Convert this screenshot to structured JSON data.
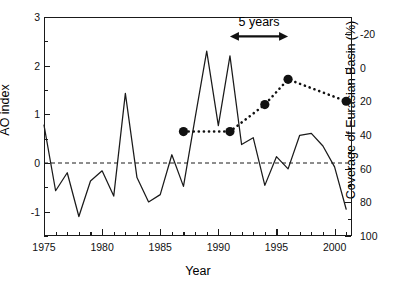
{
  "chart_data": {
    "type": "line",
    "title": "",
    "xlabel": "Year",
    "ylabel": "AO index",
    "ylabel_right": "Coverage of Eurasian Basin (%)",
    "xlim": [
      1975,
      2001.5
    ],
    "ylim": [
      -1.5,
      3
    ],
    "ylim_right": [
      100,
      -30
    ],
    "right_axis_inverted": true,
    "grid": false,
    "legend": "none",
    "x_ticks_major": [
      1975,
      1980,
      1985,
      1990,
      1995,
      2000
    ],
    "x_tick_labels": [
      "1975",
      "1980",
      "1985",
      "1990",
      "1995",
      "2000"
    ],
    "x_minor_tick_step": 1,
    "y_ticks_major_left": [
      -1,
      0,
      1,
      2,
      3
    ],
    "y_tick_labels_left": [
      "-1",
      "0",
      "1",
      "2",
      "3"
    ],
    "y_minor_ticks_left": [
      -1.5,
      -0.5,
      0.5,
      1.5,
      2.5
    ],
    "y_ticks_major_right": [
      -20,
      0,
      20,
      40,
      60,
      80,
      100
    ],
    "y_tick_labels_right": [
      "-20",
      "0",
      "20",
      "40",
      "60",
      "80",
      "100"
    ],
    "y_minor_ticks_right": [
      -30,
      -10,
      10,
      30,
      50,
      70,
      90
    ],
    "reference_line": {
      "axis": "left",
      "value": 0,
      "style": "dashed",
      "label": ""
    },
    "series": [
      {
        "name": "AO index",
        "axis": "left",
        "style": "solid-line",
        "marker": "none",
        "color": "#1a1a1a",
        "x": [
          1975,
          1976,
          1977,
          1978,
          1979,
          1980,
          1981,
          1982,
          1983,
          1984,
          1985,
          1986,
          1987,
          1988,
          1989,
          1990,
          1991,
          1992,
          1993,
          1994,
          1995,
          1996,
          1997,
          1998,
          1999,
          2000,
          2001
        ],
        "values": [
          0.78,
          -0.57,
          -0.2,
          -1.1,
          -0.37,
          -0.16,
          -0.68,
          1.43,
          -0.3,
          -0.8,
          -0.65,
          0.17,
          -0.48,
          0.92,
          2.3,
          0.77,
          2.2,
          0.38,
          0.52,
          -0.46,
          0.13,
          -0.12,
          0.57,
          0.61,
          0.35,
          -0.08,
          -0.95
        ]
      },
      {
        "name": "Coverage of Eurasian Basin",
        "axis": "right",
        "style": "dotted-line",
        "marker": "filled-circle",
        "color": "#111111",
        "x": [
          1987,
          1991,
          1994,
          1996,
          2001
        ],
        "values": [
          38,
          38,
          22,
          7,
          20
        ]
      }
    ],
    "annotations": [
      {
        "name": "five-years-span",
        "text": "5 years",
        "type": "double-arrow",
        "x_start": 1991,
        "x_end": 1996,
        "y_left_axis": 2.6,
        "label_y_left_axis": 2.88
      }
    ]
  }
}
